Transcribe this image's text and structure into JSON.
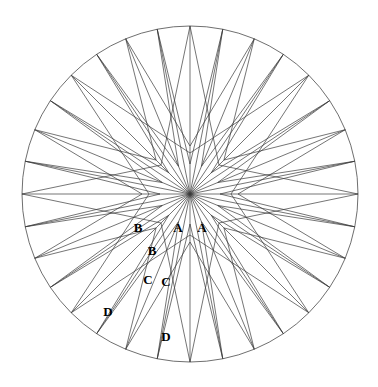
{
  "figure": {
    "name": "compass-rose",
    "type": "compass-rose-diagram",
    "background_color": "#ffffff",
    "line_color": "#3a3a3a",
    "circle_color": "#4a4a4a",
    "label_color": "#000000",
    "center": {
      "x": 190,
      "y": 194
    },
    "radius": 168,
    "point_count": 32
  },
  "labels": [
    {
      "text": "B",
      "x": 138,
      "y": 229
    },
    {
      "text": "A",
      "x": 178,
      "y": 229
    },
    {
      "text": "A",
      "x": 202,
      "y": 229
    },
    {
      "text": "B",
      "x": 152,
      "y": 252
    },
    {
      "text": "C",
      "x": 148,
      "y": 281
    },
    {
      "text": "C",
      "x": 166,
      "y": 283
    },
    {
      "text": "D",
      "x": 108,
      "y": 313
    },
    {
      "text": "D",
      "x": 166,
      "y": 338
    }
  ],
  "geometry": {
    "tiers": [
      {
        "name": "A",
        "order": 4,
        "radius": 168,
        "inner_radius": 41
      },
      {
        "name": "B",
        "order": 8,
        "radius": 168,
        "inner_radius": 41
      },
      {
        "name": "C",
        "order": 16,
        "radius": 168,
        "inner_radius": 30
      },
      {
        "name": "D",
        "order": 32,
        "radius": 168,
        "inner_radius": 30
      }
    ]
  }
}
